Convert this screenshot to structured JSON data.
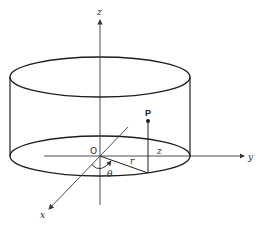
{
  "diagram": {
    "type": "cylindrical-coordinates",
    "axes": {
      "z_label": "z",
      "y_label": "y",
      "x_label": "x"
    },
    "origin_label": "O",
    "point_label": "P",
    "radius_label": "r",
    "height_label": "z",
    "angle_label": "θ",
    "colors": {
      "stroke": "#1e1e1e",
      "axis": "#3a3a3a",
      "background": "#ffffff"
    }
  },
  "caption": {
    "text": ""
  }
}
